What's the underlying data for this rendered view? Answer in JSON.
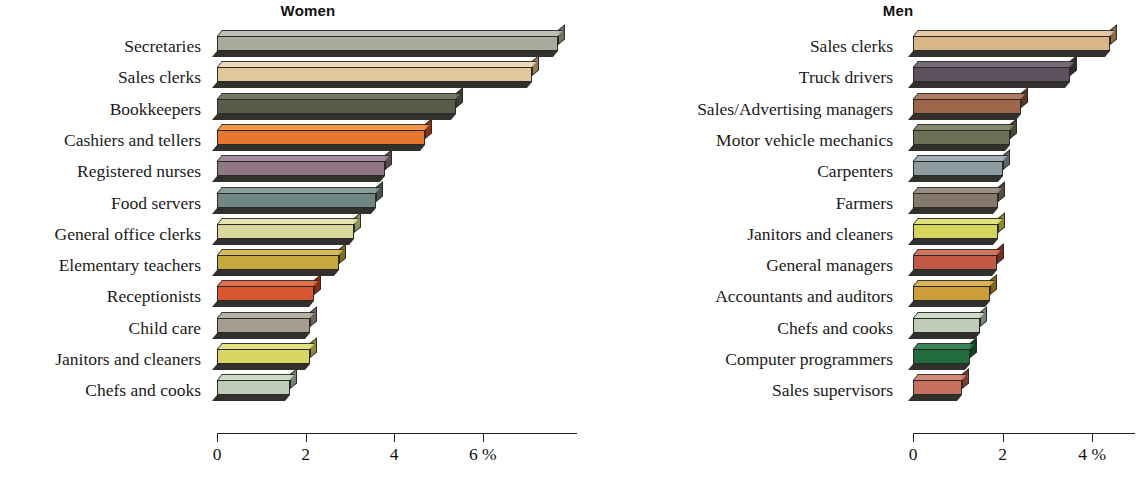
{
  "figure": {
    "background": "#ffffff",
    "panels": [
      "Women",
      "Men"
    ]
  },
  "women": {
    "title": "Women",
    "axis": {
      "ticks": [
        "0",
        "2",
        "4",
        "6 %"
      ],
      "tick_values": [
        0,
        2,
        4,
        6
      ],
      "max": 8.2
    },
    "rows": [
      {
        "label": "Secretaries",
        "value": 7.7,
        "color": "#a9ac9d",
        "top": "#b9bcae",
        "side": "#6f7363"
      },
      {
        "label": "Sales clerks",
        "value": 7.1,
        "color": "#e3c79c",
        "top": "#eed9b5",
        "side": "#9b7a56"
      },
      {
        "label": "Bookkeepers",
        "value": 5.4,
        "color": "#585d47",
        "top": "#6a6f58",
        "side": "#3b4031"
      },
      {
        "label": "Cashiers and tellers",
        "value": 4.7,
        "color": "#e8762c",
        "top": "#f2913f",
        "side": "#8e3115"
      },
      {
        "label": "Registered nurses",
        "value": 3.8,
        "color": "#8e7686",
        "top": "#9d8496",
        "side": "#5d4a57"
      },
      {
        "label": "Food servers",
        "value": 3.6,
        "color": "#6f8683",
        "top": "#809794",
        "side": "#44534f"
      },
      {
        "label": "General office clerks",
        "value": 3.1,
        "color": "#d9d99c",
        "top": "#e3e3ab",
        "side": "#8f8f5d"
      },
      {
        "label": "Elementary teachers",
        "value": 2.75,
        "color": "#c5a93c",
        "top": "#d2b74c",
        "side": "#7e6c22"
      },
      {
        "label": "Receptionists",
        "value": 2.2,
        "color": "#d9552f",
        "top": "#e4663f",
        "side": "#8a2c12"
      },
      {
        "label": "Child care",
        "value": 2.1,
        "color": "#a69d8f",
        "top": "#b4ac9f",
        "side": "#6d6559"
      },
      {
        "label": "Janitors and cleaners",
        "value": 2.1,
        "color": "#d9d565",
        "top": "#e3df78",
        "side": "#8e8b33"
      },
      {
        "label": "Chefs and cooks",
        "value": 1.65,
        "color": "#bdccb5",
        "top": "#cbd8c4",
        "side": "#75836d"
      }
    ]
  },
  "men": {
    "title": "Men",
    "axis": {
      "ticks": [
        "0",
        "2",
        "4 %"
      ],
      "tick_values": [
        0,
        2,
        4
      ],
      "max": 5.0
    },
    "rows": [
      {
        "label": "Sales clerks",
        "value": 4.4,
        "color": "#d9b588",
        "top": "#e5c59c",
        "side": "#8f6b43"
      },
      {
        "label": "Truck drivers",
        "value": 3.5,
        "color": "#5f505f",
        "top": "#6f5f70",
        "side": "#332a35"
      },
      {
        "label": "Sales/Advertising managers",
        "value": 2.4,
        "color": "#9d6549",
        "top": "#ab7457",
        "side": "#5f3424"
      },
      {
        "label": "Motor vehicle mechanics",
        "value": 2.17,
        "color": "#6c7156",
        "top": "#7b8063",
        "side": "#474b35"
      },
      {
        "label": "Carpenters",
        "value": 2.0,
        "color": "#8d9ca1",
        "top": "#9dabb0",
        "side": "#5c686c"
      },
      {
        "label": "Farmers",
        "value": 1.9,
        "color": "#86796b",
        "top": "#94877a",
        "side": "#554b41"
      },
      {
        "label": "Janitors and cleaners",
        "value": 1.9,
        "color": "#d5d55d",
        "top": "#dfdf72",
        "side": "#8a8a2e"
      },
      {
        "label": "General managers",
        "value": 1.87,
        "color": "#c15945",
        "top": "#ce6b57",
        "side": "#7a2c1e"
      },
      {
        "label": "Accountants and auditors",
        "value": 1.72,
        "color": "#cd9d39",
        "top": "#d9ad4c",
        "side": "#86631b"
      },
      {
        "label": "Chefs and cooks",
        "value": 1.5,
        "color": "#c1cdb9",
        "top": "#cedac7",
        "side": "#7a8573"
      },
      {
        "label": "Computer programmers",
        "value": 1.27,
        "color": "#206c3d",
        "top": "#2c7d4b",
        "side": "#124022"
      },
      {
        "label": "Sales supervisors",
        "value": 1.1,
        "color": "#c5715d",
        "top": "#d2826e",
        "side": "#7e3c2c"
      }
    ]
  },
  "chart_data": {
    "type": "bar",
    "orientation": "horizontal",
    "xlabel": "%",
    "ylabel": "",
    "grid": false,
    "legend": "none",
    "panels": [
      {
        "title": "Women",
        "categories": [
          "Secretaries",
          "Sales clerks",
          "Bookkeepers",
          "Cashiers and tellers",
          "Registered nurses",
          "Food servers",
          "General office clerks",
          "Elementary teachers",
          "Receptionists",
          "Child care",
          "Janitors and cleaners",
          "Chefs and cooks"
        ],
        "values": [
          7.7,
          7.1,
          5.4,
          4.7,
          3.8,
          3.6,
          3.1,
          2.75,
          2.2,
          2.1,
          2.1,
          1.65
        ],
        "xticks": [
          0,
          2,
          4,
          6
        ],
        "xticklabels": [
          "0",
          "2",
          "4",
          "6 %"
        ],
        "xlim": [
          0,
          8.2
        ]
      },
      {
        "title": "Men",
        "categories": [
          "Sales clerks",
          "Truck drivers",
          "Sales/Advertising managers",
          "Motor vehicle mechanics",
          "Carpenters",
          "Farmers",
          "Janitors and cleaners",
          "General managers",
          "Accountants and auditors",
          "Chefs and cooks",
          "Computer programmers",
          "Sales supervisors"
        ],
        "values": [
          4.4,
          3.5,
          2.4,
          2.17,
          2.0,
          1.9,
          1.9,
          1.87,
          1.72,
          1.5,
          1.27,
          1.1
        ],
        "xticks": [
          0,
          2,
          4
        ],
        "xticklabels": [
          "0",
          "2",
          "4 %"
        ],
        "xlim": [
          0,
          5.0
        ]
      }
    ]
  }
}
